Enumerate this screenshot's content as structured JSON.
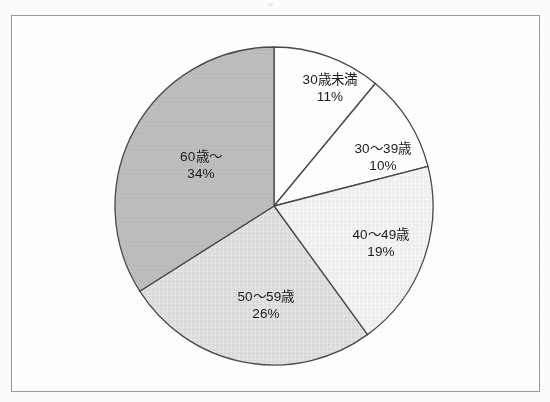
{
  "figure": {
    "background_color": "#ffffff",
    "frame_color": "#9a9a9a",
    "outline_color": "#4a4a4a",
    "label_text_color": "#1b1b1b"
  },
  "chart_data": {
    "type": "pie",
    "title": "",
    "xlabel": "",
    "ylabel": "",
    "legend_position": "none",
    "grid": false,
    "start_angle_deg": 90,
    "direction": "clockwise",
    "units": "%",
    "total": 100,
    "categories": [
      "30歳未満",
      "30〜39歳",
      "40〜49歳",
      "50〜59歳",
      "60歳〜"
    ],
    "values": [
      11,
      10,
      19,
      26,
      34
    ],
    "slices": [
      {
        "label": "30歳未満",
        "value": 11,
        "value_text": "11%",
        "fill": "#ffffff",
        "pattern": "none",
        "label_x": 330,
        "label_y": 88
      },
      {
        "label": "30〜39歳",
        "value": 10,
        "value_text": "10%",
        "fill": "#ffffff",
        "pattern": "none",
        "label_x": 383,
        "label_y": 157
      },
      {
        "label": "40〜49歳",
        "value": 19,
        "value_text": "19%",
        "fill": "#f4f4f4",
        "pattern": "fine-crosshatch",
        "label_x": 381,
        "label_y": 243
      },
      {
        "label": "50〜59歳",
        "value": 26,
        "value_text": "26%",
        "fill": "#e2e2e2",
        "pattern": "crosshatch",
        "label_x": 266,
        "label_y": 305
      },
      {
        "label": "60歳〜",
        "value": 34,
        "value_text": "34%",
        "fill": "#bdbdbd",
        "pattern": "solid-gray",
        "label_x": 201,
        "label_y": 165
      }
    ],
    "geometry": {
      "center_x": 274,
      "center_y": 206,
      "radius": 159
    }
  }
}
